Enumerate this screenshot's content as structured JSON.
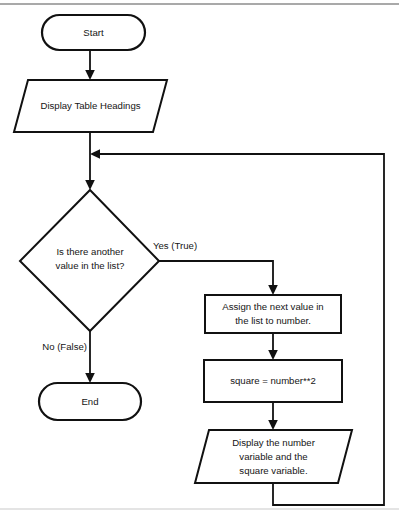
{
  "diagram": {
    "type": "flowchart",
    "background_color": "#ffffff",
    "line_color": "#111111",
    "page_border_color": "#8d8d8d",
    "nodes": [
      {
        "id": "start",
        "shape": "terminator",
        "label": "Start"
      },
      {
        "id": "display_headings",
        "shape": "parallelogram",
        "label": "Display Table Headings"
      },
      {
        "id": "decision",
        "shape": "diamond",
        "label_line1": "Is there another",
        "label_line2": "value in the list?"
      },
      {
        "id": "assign",
        "shape": "rectangle",
        "label_line1": "Assign the next value in",
        "label_line2": "the list to number."
      },
      {
        "id": "square",
        "shape": "rectangle",
        "label": "square = number**2"
      },
      {
        "id": "display_values",
        "shape": "parallelogram",
        "label_line1": "Display the number",
        "label_line2": "variable and the",
        "label_line3": "square variable."
      },
      {
        "id": "end",
        "shape": "terminator",
        "label": "End"
      }
    ],
    "edges": [
      {
        "id": "start_to_headings",
        "from": "start",
        "to": "display_headings",
        "label": ""
      },
      {
        "id": "headings_to_decision",
        "from": "display_headings",
        "to": "decision",
        "label": ""
      },
      {
        "id": "decision_yes",
        "from": "decision",
        "to": "assign",
        "label": "Yes (True)"
      },
      {
        "id": "decision_no",
        "from": "decision",
        "to": "end",
        "label": "No (False)"
      },
      {
        "id": "assign_to_square",
        "from": "assign",
        "to": "square",
        "label": ""
      },
      {
        "id": "square_to_display",
        "from": "square",
        "to": "display_values",
        "label": ""
      },
      {
        "id": "loop_back",
        "from": "display_values",
        "to": "decision",
        "label": ""
      }
    ]
  }
}
